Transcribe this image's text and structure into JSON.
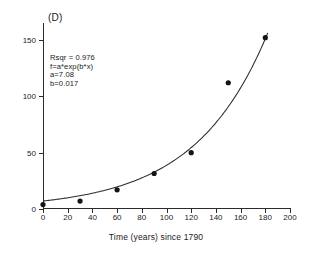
{
  "panel": {
    "label": "(D)"
  },
  "annotation": {
    "rsqr": "Rsqr = 0.976",
    "formula": "f=a*exp(b*x)",
    "a": "a=7.08",
    "b": "b=0.017"
  },
  "axes": {
    "x_title": "Time (years) since 1790",
    "y_title": "",
    "x_ticklabels": [
      "0",
      "20",
      "40",
      "60",
      "80",
      "100",
      "120",
      "140",
      "160",
      "180",
      "200"
    ],
    "y_ticklabels": [
      "0",
      "50",
      "100",
      "150"
    ]
  },
  "colors": {
    "axis": "#2b2b2b",
    "marker": "#141414",
    "curve": "#2b2b2b",
    "background": "#ffffff"
  },
  "chart_data": {
    "type": "scatter",
    "title": "(D)",
    "xlabel": "Time (years) since 1790",
    "ylabel": "",
    "xlim": [
      0,
      200
    ],
    "ylim": [
      0,
      165
    ],
    "xticks": [
      0,
      20,
      40,
      60,
      80,
      100,
      120,
      140,
      160,
      180,
      200
    ],
    "yticks": [
      0,
      50,
      100,
      150
    ],
    "grid": false,
    "legend": null,
    "series": [
      {
        "name": "observed",
        "marker": "filled-circle",
        "x": [
          0,
          30,
          60,
          90,
          120,
          150,
          180
        ],
        "y": [
          3.9,
          7.0,
          17.0,
          31.5,
          50.0,
          112.0,
          152.0
        ]
      }
    ],
    "fit": {
      "name": "exponential fit",
      "equation": "f=a*exp(b*x)",
      "a": 7.08,
      "b": 0.017,
      "rsqr": 0.976,
      "x_range": [
        0,
        182
      ]
    },
    "annotations": [
      "Rsqr = 0.976",
      "f=a*exp(b*x)",
      "a=7.08",
      "b=0.017"
    ]
  }
}
